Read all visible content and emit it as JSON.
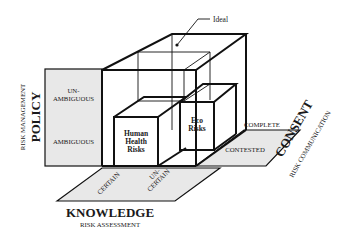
{
  "diagram": {
    "ideal_label": "Ideal",
    "policy": {
      "title": "POLICY",
      "subtitle": "RISK MANAGEMENT",
      "levels": {
        "top_line1": "UN-",
        "top_line2": "AMBIGUOUS",
        "bottom": "AMBIGUOUS"
      }
    },
    "knowledge": {
      "title": "KNOWLEDGE",
      "subtitle": "RISK ASSESSMENT",
      "levels": {
        "left": "CERTAIN",
        "right_line1": "UN-",
        "right_line2": "CERTAIN"
      }
    },
    "consent": {
      "title": "CONSENT",
      "subtitle": "RISK COMMUNICATION",
      "levels": {
        "back": "COMPLETE",
        "front": "CONTESTED"
      }
    },
    "boxes": {
      "human_health": {
        "line1": "Human",
        "line2": "Health",
        "line3": "Risks"
      },
      "eco": {
        "line1": "Eco",
        "line2": "Risks"
      }
    },
    "colors": {
      "panel_fill": "#e8e8e8",
      "line": "#111111"
    }
  }
}
